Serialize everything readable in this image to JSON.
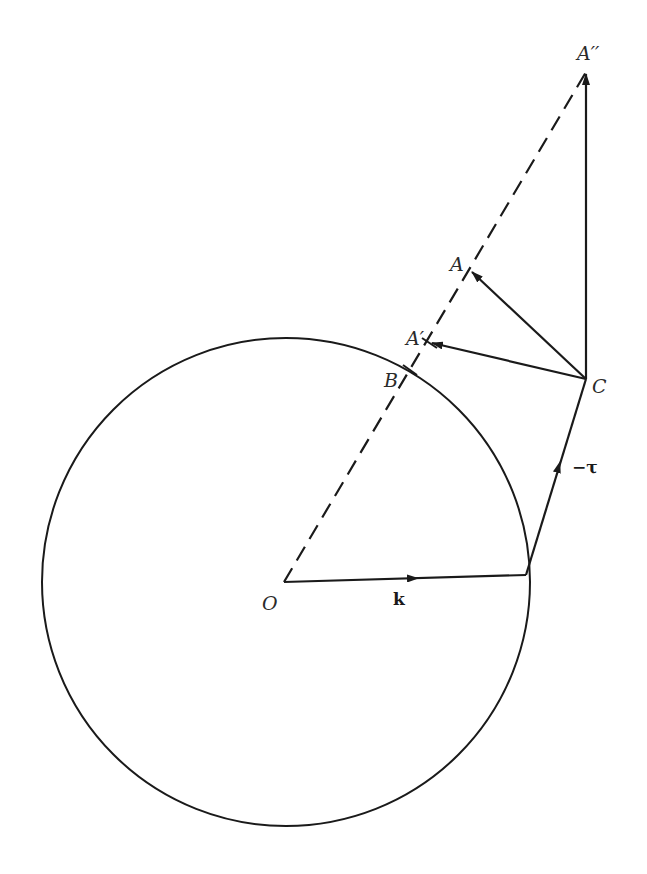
{
  "diagram": {
    "colors": {
      "stroke": "#1a1a1a",
      "background": "#ffffff"
    },
    "labels": {
      "O": "O",
      "k": "k",
      "neg_tau": "−τ",
      "B": "B",
      "C": "C",
      "A": "A",
      "A_prime": "A′",
      "A_double_prime": "A′′"
    },
    "points": {
      "O": [
        284,
        582
      ],
      "K_end": [
        526,
        575
      ],
      "C": [
        586,
        379
      ],
      "A": [
        470,
        270
      ],
      "A_prime": [
        430,
        343
      ],
      "B": [
        410,
        370
      ],
      "A_double_prime": [
        586,
        72
      ]
    },
    "circle": {
      "cx": 286,
      "cy": 582,
      "r": 244
    }
  }
}
